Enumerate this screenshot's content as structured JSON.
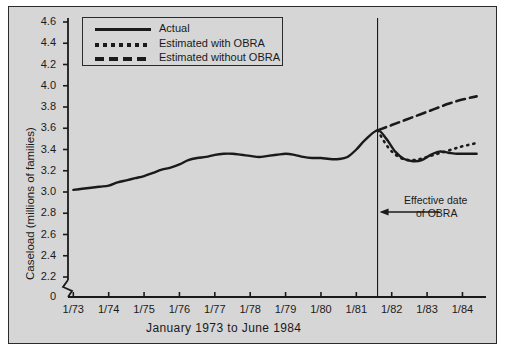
{
  "figure": {
    "background_color": "#d6d6d6",
    "frame_color": "#2b2b2b",
    "line_color": "#1a1a1a"
  },
  "legend": {
    "position": "top-left-inside",
    "entries": [
      {
        "label": "Actual",
        "style": "solid",
        "swatch_name": "legend-swatch-solid"
      },
      {
        "label": "Estimated with OBRA",
        "style": "dotted",
        "swatch_name": "legend-swatch-dotted"
      },
      {
        "label": "Estimated without OBRA",
        "style": "dashed",
        "swatch_name": "legend-swatch-dashed"
      }
    ]
  },
  "annotation": {
    "line1": "Effective date",
    "line2": "of OBRA",
    "arrow": "left-arrow",
    "marker_x_label": "1981.6"
  },
  "chart_data": {
    "type": "line",
    "title": "",
    "xlabel": "January 1973 to June 1984",
    "ylabel": "Caseload (millions of families)",
    "xlim": [
      1973.0,
      1984.5
    ],
    "ylim": [
      2.2,
      4.6
    ],
    "y_axis_break": true,
    "y_axis_break_value": 0,
    "grid": false,
    "xticks": [
      "1/73",
      "1/74",
      "1/75",
      "1/76",
      "1/77",
      "1/78",
      "1/79",
      "1/80",
      "1/81",
      "1/82",
      "1/83",
      "1/84"
    ],
    "xtick_values": [
      1973,
      1974,
      1975,
      1976,
      1977,
      1978,
      1979,
      1980,
      1981,
      1982,
      1983,
      1984
    ],
    "yticks": [
      "0",
      "2.2",
      "2.4",
      "2.6",
      "2.8",
      "3.0",
      "3.2",
      "3.4",
      "3.6",
      "3.8",
      "4.0",
      "4.2",
      "4.4",
      "4.6"
    ],
    "ytick_values": [
      0,
      2.2,
      2.4,
      2.6,
      2.8,
      3.0,
      3.2,
      3.4,
      3.6,
      3.8,
      4.0,
      4.2,
      4.4,
      4.6
    ],
    "vline_x": 1981.6,
    "series": [
      {
        "name": "Actual",
        "style": "solid",
        "x": [
          1973.0,
          1973.25,
          1973.5,
          1973.75,
          1974.0,
          1974.25,
          1974.5,
          1974.75,
          1975.0,
          1975.25,
          1975.5,
          1975.75,
          1976.0,
          1976.25,
          1976.5,
          1976.75,
          1977.0,
          1977.25,
          1977.5,
          1977.75,
          1978.0,
          1978.25,
          1978.5,
          1978.75,
          1979.0,
          1979.25,
          1979.5,
          1979.75,
          1980.0,
          1980.25,
          1980.5,
          1980.75,
          1981.0,
          1981.25,
          1981.6,
          1981.85,
          1982.1,
          1982.35,
          1982.6,
          1982.85,
          1983.1,
          1983.35,
          1983.6,
          1983.85,
          1984.1,
          1984.4
        ],
        "y": [
          3.02,
          3.03,
          3.04,
          3.05,
          3.06,
          3.09,
          3.11,
          3.13,
          3.15,
          3.18,
          3.21,
          3.23,
          3.26,
          3.3,
          3.32,
          3.33,
          3.35,
          3.36,
          3.36,
          3.35,
          3.34,
          3.33,
          3.34,
          3.35,
          3.36,
          3.35,
          3.33,
          3.32,
          3.32,
          3.31,
          3.31,
          3.33,
          3.4,
          3.49,
          3.58,
          3.5,
          3.38,
          3.31,
          3.29,
          3.3,
          3.35,
          3.38,
          3.37,
          3.36,
          3.36,
          3.36
        ]
      },
      {
        "name": "Estimated with OBRA",
        "style": "dotted",
        "x": [
          1981.6,
          1981.9,
          1982.2,
          1982.5,
          1982.8,
          1983.1,
          1983.4,
          1983.7,
          1984.0,
          1984.4
        ],
        "y": [
          3.58,
          3.42,
          3.33,
          3.3,
          3.31,
          3.34,
          3.37,
          3.4,
          3.43,
          3.46
        ]
      },
      {
        "name": "Estimated without OBRA",
        "style": "dashed",
        "x": [
          1981.6,
          1982.0,
          1982.4,
          1982.8,
          1983.2,
          1983.6,
          1984.0,
          1984.4
        ],
        "y": [
          3.58,
          3.63,
          3.68,
          3.73,
          3.78,
          3.83,
          3.87,
          3.9
        ]
      }
    ]
  }
}
